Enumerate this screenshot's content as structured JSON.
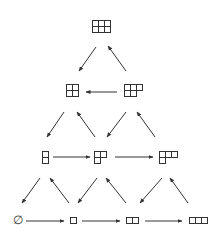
{
  "colors": {
    "stroke": "#333333",
    "background": "#ffffff"
  },
  "cell_size": 6,
  "nodes": [
    {
      "id": "p33",
      "label": "(3,3)",
      "rows": [
        3,
        3
      ],
      "cx": 101,
      "cy": 26
    },
    {
      "id": "p22",
      "label": "(2,2)",
      "rows": [
        2,
        2
      ],
      "cx": 72,
      "cy": 90
    },
    {
      "id": "p32",
      "label": "(3,2)",
      "rows": [
        3,
        2
      ],
      "cx": 133,
      "cy": 90
    },
    {
      "id": "p11",
      "label": "(1,1)",
      "rows": [
        1,
        1
      ],
      "cx": 45,
      "cy": 157
    },
    {
      "id": "p21",
      "label": "(2,1)",
      "rows": [
        2,
        1
      ],
      "cx": 100,
      "cy": 157
    },
    {
      "id": "p31",
      "label": "(3,1)",
      "rows": [
        3,
        1
      ],
      "cx": 168,
      "cy": 157
    },
    {
      "id": "empty",
      "label": "∅",
      "rows": [],
      "cx": 18,
      "cy": 220
    },
    {
      "id": "p1",
      "label": "(1)",
      "rows": [
        1
      ],
      "cx": 73,
      "cy": 220
    },
    {
      "id": "p2",
      "label": "(2)",
      "rows": [
        2
      ],
      "cx": 132,
      "cy": 220
    },
    {
      "id": "p3",
      "label": "(3)",
      "rows": [
        3
      ],
      "cx": 198,
      "cy": 220
    }
  ],
  "edges": [
    {
      "from": "p33",
      "to": "p22",
      "x1": 96,
      "y1": 47,
      "x2": 79,
      "y2": 71
    },
    {
      "from": "p32",
      "to": "p33",
      "x1": 126,
      "y1": 71,
      "x2": 108,
      "y2": 46
    },
    {
      "from": "p32",
      "to": "p22",
      "x1": 117,
      "y1": 92,
      "x2": 86,
      "y2": 92
    },
    {
      "from": "p22",
      "to": "p11",
      "x1": 64,
      "y1": 112,
      "x2": 47,
      "y2": 137
    },
    {
      "from": "p21",
      "to": "p22",
      "x1": 95,
      "y1": 137,
      "x2": 77,
      "y2": 112
    },
    {
      "from": "p32",
      "to": "p21",
      "x1": 126,
      "y1": 112,
      "x2": 107,
      "y2": 137
    },
    {
      "from": "p31",
      "to": "p32",
      "x1": 155,
      "y1": 137,
      "x2": 137,
      "y2": 112
    },
    {
      "from": "p11",
      "to": "p21",
      "x1": 53,
      "y1": 157,
      "x2": 90,
      "y2": 157
    },
    {
      "from": "p21",
      "to": "p31",
      "x1": 115,
      "y1": 157,
      "x2": 153,
      "y2": 157
    },
    {
      "from": "p11",
      "to": "empty",
      "x1": 40,
      "y1": 178,
      "x2": 22,
      "y2": 203
    },
    {
      "from": "p1",
      "to": "p11",
      "x1": 69,
      "y1": 203,
      "x2": 50,
      "y2": 178
    },
    {
      "from": "p21",
      "to": "p1",
      "x1": 97,
      "y1": 178,
      "x2": 78,
      "y2": 203
    },
    {
      "from": "p2",
      "to": "p21",
      "x1": 126,
      "y1": 203,
      "x2": 106,
      "y2": 178
    },
    {
      "from": "p31",
      "to": "p2",
      "x1": 162,
      "y1": 178,
      "x2": 140,
      "y2": 203
    },
    {
      "from": "p3",
      "to": "p31",
      "x1": 188,
      "y1": 203,
      "x2": 170,
      "y2": 178
    },
    {
      "from": "empty",
      "to": "p1",
      "x1": 26,
      "y1": 221,
      "x2": 64,
      "y2": 221
    },
    {
      "from": "p1",
      "to": "p2",
      "x1": 82,
      "y1": 221,
      "x2": 120,
      "y2": 221
    },
    {
      "from": "p2",
      "to": "p3",
      "x1": 145,
      "y1": 221,
      "x2": 182,
      "y2": 221
    }
  ]
}
